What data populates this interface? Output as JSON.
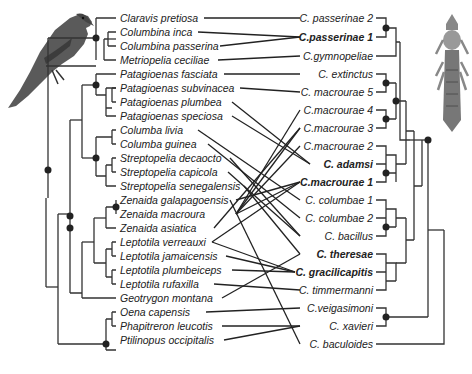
{
  "figure": {
    "host_icon": "dove-illustration",
    "parasite_icon": "louse-illustration"
  },
  "hosts": [
    {
      "name": "Claravis pretiosa",
      "y": 18
    },
    {
      "name": "Columbina inca",
      "y": 32
    },
    {
      "name": "Columbina passerina",
      "y": 46
    },
    {
      "name": "Metriopelia ceciliae",
      "y": 60
    },
    {
      "name": "Patagioenas fasciata",
      "y": 74
    },
    {
      "name": "Patagioenas subvinacea",
      "y": 88
    },
    {
      "name": "Patagioenas plumbea",
      "y": 102
    },
    {
      "name": "Patagioenas speciosa",
      "y": 116
    },
    {
      "name": "Columba livia",
      "y": 130
    },
    {
      "name": "Columba guinea",
      "y": 144
    },
    {
      "name": "Streptopelia decaocto",
      "y": 158
    },
    {
      "name": "Streptopelia capicola",
      "y": 172
    },
    {
      "name": "Streptopelia senegalensis",
      "y": 186
    },
    {
      "name": "Zenaida galapagoensis",
      "y": 200
    },
    {
      "name": "Zenaida macroura",
      "y": 214
    },
    {
      "name": "Zenaida asiatica",
      "y": 228
    },
    {
      "name": "Leptotila verreauxi",
      "y": 242
    },
    {
      "name": "Leptotila jamaicensis",
      "y": 256
    },
    {
      "name": "Leptotila plumbeiceps",
      "y": 270
    },
    {
      "name": "Leptotila rufaxilla",
      "y": 284
    },
    {
      "name": "Geotrygon montana",
      "y": 298
    },
    {
      "name": "Oena capensis",
      "y": 312
    },
    {
      "name": "Phapitreron leucotis",
      "y": 326
    },
    {
      "name": "Ptilinopus occipitalis",
      "y": 340
    }
  ],
  "parasites": [
    {
      "name": "C. passerinae 2",
      "y": 18,
      "bold": false
    },
    {
      "name": "C.passerinae 1",
      "y": 37,
      "bold": true
    },
    {
      "name": "C.gymnopeliae",
      "y": 56,
      "bold": false
    },
    {
      "name": "C. extinctus",
      "y": 74,
      "bold": false
    },
    {
      "name": "C. macrourae 5",
      "y": 92,
      "bold": false
    },
    {
      "name": "C.macrourae 4",
      "y": 110,
      "bold": false
    },
    {
      "name": "C.macrourae 3",
      "y": 128,
      "bold": false
    },
    {
      "name": "C.macrourae 2",
      "y": 146,
      "bold": false
    },
    {
      "name": "C.  adamsi",
      "y": 164,
      "bold": true
    },
    {
      "name": "C.macrourae 1",
      "y": 182,
      "bold": true
    },
    {
      "name": "C. columbae 1",
      "y": 200,
      "bold": false
    },
    {
      "name": "C. columbae 2",
      "y": 218,
      "bold": false
    },
    {
      "name": "C. bacillus",
      "y": 236,
      "bold": false
    },
    {
      "name": "C. theresae",
      "y": 254,
      "bold": true
    },
    {
      "name": "C. gracilicapitis",
      "y": 272,
      "bold": true
    },
    {
      "name": "C. timmermanni",
      "y": 290,
      "bold": false
    },
    {
      "name": "C.veigasimoni",
      "y": 308,
      "bold": false
    },
    {
      "name": "C. xavieri",
      "y": 326,
      "bold": false
    },
    {
      "name": "C. baculoides",
      "y": 344,
      "bold": false
    }
  ]
}
